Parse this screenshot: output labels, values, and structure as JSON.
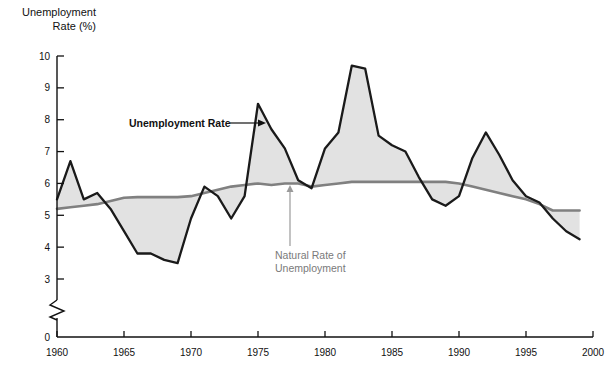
{
  "chart_data": {
    "type": "line",
    "title": "",
    "xlabel": "",
    "ylabel": "Unemployment Rate (%)",
    "xlim": [
      1960,
      2000
    ],
    "ylim": [
      3,
      10
    ],
    "y_axis_break": true,
    "y_axis_break_note": "axis broken between 0 and 3",
    "grid": false,
    "legend_position": "inline-annotations",
    "x_ticks": [
      "1960",
      "1965",
      "1970",
      "1975",
      "1980",
      "1985",
      "1990",
      "1995",
      "2000"
    ],
    "x_tick_values": [
      1960,
      1965,
      1970,
      1975,
      1980,
      1985,
      1990,
      1995,
      2000
    ],
    "y_ticks": [
      "0",
      "3",
      "4",
      "5",
      "6",
      "7",
      "8",
      "9",
      "10"
    ],
    "y_tick_values": [
      0,
      3,
      4,
      5,
      6,
      7,
      8,
      9,
      10
    ],
    "x": [
      1960,
      1961,
      1962,
      1963,
      1964,
      1965,
      1966,
      1967,
      1968,
      1969,
      1970,
      1971,
      1972,
      1973,
      1974,
      1975,
      1976,
      1977,
      1978,
      1979,
      1980,
      1981,
      1982,
      1983,
      1984,
      1985,
      1986,
      1987,
      1988,
      1989,
      1990,
      1991,
      1992,
      1993,
      1994,
      1995,
      1996,
      1997,
      1998,
      1999
    ],
    "series": [
      {
        "name": "Unemployment Rate",
        "color": "#1a1a1a",
        "values": [
          5.5,
          6.7,
          5.5,
          5.7,
          5.2,
          4.5,
          3.8,
          3.8,
          3.6,
          3.5,
          4.9,
          5.9,
          5.6,
          4.9,
          5.6,
          8.5,
          7.7,
          7.1,
          6.1,
          5.85,
          7.1,
          7.6,
          9.7,
          9.6,
          7.5,
          7.2,
          7.0,
          6.2,
          5.5,
          5.3,
          5.6,
          6.8,
          7.6,
          6.9,
          6.1,
          5.6,
          5.4,
          4.9,
          4.5,
          4.25
        ]
      },
      {
        "name": "Natural Rate of Unemployment",
        "color": "#808080",
        "values": [
          5.2,
          5.25,
          5.3,
          5.35,
          5.45,
          5.55,
          5.57,
          5.57,
          5.57,
          5.57,
          5.6,
          5.7,
          5.8,
          5.9,
          5.95,
          6.0,
          5.95,
          6.0,
          6.0,
          5.9,
          5.95,
          6.0,
          6.05,
          6.05,
          6.05,
          6.05,
          6.05,
          6.05,
          6.05,
          6.05,
          6.0,
          5.9,
          5.8,
          5.7,
          5.6,
          5.5,
          5.35,
          5.15,
          5.15,
          5.15
        ]
      }
    ],
    "annotations": [
      {
        "text": "Unemployment Rate",
        "color": "#111111",
        "pointer": "arrow-right"
      },
      {
        "text": "Natural Rate of",
        "color": "#7a7a7a",
        "pointer": "arrow-up"
      },
      {
        "text": "Unemployment",
        "color": "#7a7a7a",
        "pointer": "none"
      }
    ],
    "fill_between_note": "region between the two lines shaded light gray",
    "fill_color": "#e2e2e2"
  },
  "labels": {
    "ylabel_line1": "Unemployment",
    "ylabel_line2": "Rate (%)",
    "annot_unemployment": "Unemployment Rate",
    "annot_natural_line1": "Natural Rate of",
    "annot_natural_line2": "Unemployment"
  }
}
